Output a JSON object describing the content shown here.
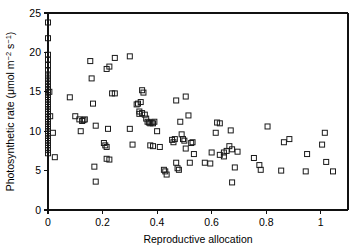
{
  "figure": {
    "background_color": "#ffffff",
    "marker_color": "#1a1a1a",
    "axis_color": "#111111"
  },
  "chart_data": {
    "type": "scatter",
    "title": "",
    "xlabel": "Reproductive allocation",
    "ylabel": "Photosynthetic rate (μmol m⁻² s⁻¹)",
    "ylabel_parts": {
      "text": "Photosynthetic rate (μmol m",
      "sup1": "−2",
      "mid": " s",
      "sup2": "−1",
      "close": ")"
    },
    "xlim": [
      0,
      1.1
    ],
    "ylim": [
      0,
      25
    ],
    "xticks": [
      0,
      0.2,
      0.4,
      0.6,
      0.8,
      1
    ],
    "xticklabels": [
      "0",
      "0.2",
      "0.4",
      "0.6",
      "0.8",
      "1"
    ],
    "yticks": [
      0,
      5,
      10,
      15,
      20,
      25
    ],
    "yticklabels": [
      "0",
      "5",
      "10",
      "15",
      "20",
      "25"
    ],
    "grid": false,
    "legend": null,
    "marker": "open-square",
    "marker_size": 5,
    "points": [
      [
        0.0,
        23.8
      ],
      [
        0.0,
        21.8
      ],
      [
        0.0,
        19.7
      ],
      [
        0.0,
        19.1
      ],
      [
        0.0,
        18.4
      ],
      [
        0.0,
        17.7
      ],
      [
        0.0,
        17.2
      ],
      [
        0.0,
        16.8
      ],
      [
        0.0,
        16.4
      ],
      [
        0.0,
        16.0
      ],
      [
        0.0,
        15.6
      ],
      [
        0.0,
        15.2
      ],
      [
        0.005,
        15.0
      ],
      [
        0.0,
        14.9
      ],
      [
        0.0,
        14.6
      ],
      [
        0.0,
        14.3
      ],
      [
        0.0,
        14.0
      ],
      [
        0.0,
        13.7
      ],
      [
        0.0,
        13.4
      ],
      [
        0.0,
        13.1
      ],
      [
        0.0,
        12.8
      ],
      [
        0.0,
        12.5
      ],
      [
        0.0,
        12.2
      ],
      [
        0.008,
        11.9
      ],
      [
        0.0,
        11.8
      ],
      [
        0.0,
        11.5
      ],
      [
        0.0,
        11.2
      ],
      [
        0.0,
        10.9
      ],
      [
        0.0,
        10.6
      ],
      [
        0.0,
        10.3
      ],
      [
        0.0,
        10.0
      ],
      [
        0.0,
        9.7
      ],
      [
        0.0,
        9.4
      ],
      [
        0.0,
        9.1
      ],
      [
        0.0,
        8.8
      ],
      [
        0.0,
        8.5
      ],
      [
        0.0,
        8.2
      ],
      [
        0.0,
        7.9
      ],
      [
        0.0,
        7.6
      ],
      [
        0.0,
        7.2
      ],
      [
        0.018,
        9.8
      ],
      [
        0.025,
        6.7
      ],
      [
        0.08,
        14.3
      ],
      [
        0.1,
        11.9
      ],
      [
        0.115,
        11.5
      ],
      [
        0.125,
        11.3
      ],
      [
        0.13,
        11.4
      ],
      [
        0.135,
        11.5
      ],
      [
        0.12,
        10.0
      ],
      [
        0.155,
        18.9
      ],
      [
        0.16,
        16.7
      ],
      [
        0.165,
        13.5
      ],
      [
        0.175,
        10.7
      ],
      [
        0.17,
        5.5
      ],
      [
        0.175,
        3.6
      ],
      [
        0.205,
        8.5
      ],
      [
        0.21,
        8.2
      ],
      [
        0.215,
        8.0
      ],
      [
        0.22,
        10.3
      ],
      [
        0.215,
        6.5
      ],
      [
        0.225,
        6.4
      ],
      [
        0.215,
        17.9
      ],
      [
        0.225,
        18.2
      ],
      [
        0.235,
        14.8
      ],
      [
        0.245,
        14.8
      ],
      [
        0.245,
        19.3
      ],
      [
        0.3,
        19.5
      ],
      [
        0.3,
        10.3
      ],
      [
        0.31,
        8.3
      ],
      [
        0.325,
        13.4
      ],
      [
        0.33,
        13.5
      ],
      [
        0.335,
        12.2
      ],
      [
        0.335,
        12.5
      ],
      [
        0.34,
        13.7
      ],
      [
        0.345,
        12.3
      ],
      [
        0.345,
        15.2
      ],
      [
        0.35,
        14.9
      ],
      [
        0.355,
        12.1
      ],
      [
        0.36,
        11.6
      ],
      [
        0.365,
        11.2
      ],
      [
        0.37,
        11.1
      ],
      [
        0.375,
        11.0
      ],
      [
        0.38,
        11.1
      ],
      [
        0.385,
        11.0
      ],
      [
        0.39,
        11.2
      ],
      [
        0.375,
        8.2
      ],
      [
        0.385,
        8.1
      ],
      [
        0.4,
        10.0
      ],
      [
        0.41,
        8.0
      ],
      [
        0.425,
        5.1
      ],
      [
        0.43,
        4.9
      ],
      [
        0.435,
        4.5
      ],
      [
        0.455,
        8.9
      ],
      [
        0.46,
        8.6
      ],
      [
        0.465,
        9.0
      ],
      [
        0.47,
        6.0
      ],
      [
        0.475,
        5.3
      ],
      [
        0.48,
        5.1
      ],
      [
        0.47,
        13.9
      ],
      [
        0.485,
        11.2
      ],
      [
        0.49,
        9.6
      ],
      [
        0.495,
        9.0
      ],
      [
        0.5,
        8.8
      ],
      [
        0.505,
        7.8
      ],
      [
        0.505,
        14.4
      ],
      [
        0.515,
        12.0
      ],
      [
        0.525,
        8.5
      ],
      [
        0.53,
        8.6
      ],
      [
        0.52,
        6.0
      ],
      [
        0.535,
        7.1
      ],
      [
        0.575,
        6.0
      ],
      [
        0.595,
        5.9
      ],
      [
        0.6,
        7.3
      ],
      [
        0.615,
        9.8
      ],
      [
        0.62,
        11.1
      ],
      [
        0.63,
        11.0
      ],
      [
        0.63,
        7.0
      ],
      [
        0.645,
        6.8
      ],
      [
        0.645,
        7.3
      ],
      [
        0.655,
        7.5
      ],
      [
        0.665,
        8.1
      ],
      [
        0.67,
        10.1
      ],
      [
        0.675,
        7.7
      ],
      [
        0.675,
        3.5
      ],
      [
        0.685,
        5.4
      ],
      [
        0.695,
        7.4
      ],
      [
        0.755,
        6.6
      ],
      [
        0.775,
        5.7
      ],
      [
        0.78,
        5.1
      ],
      [
        0.805,
        10.6
      ],
      [
        0.855,
        5.0
      ],
      [
        0.865,
        8.6
      ],
      [
        0.885,
        9.0
      ],
      [
        0.945,
        4.9
      ],
      [
        0.95,
        7.1
      ],
      [
        1.005,
        8.3
      ],
      [
        1.015,
        9.8
      ],
      [
        1.02,
        6.1
      ],
      [
        1.045,
        4.9
      ]
    ]
  }
}
